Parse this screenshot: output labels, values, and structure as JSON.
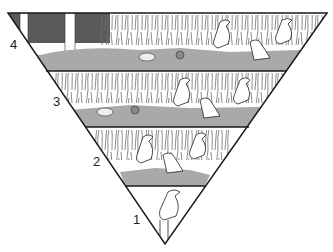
{
  "diagram": {
    "type": "ecological-pyramid",
    "orientation": "inverted-triangle",
    "top_caption_cropped": "(text cut off at top edge)",
    "levels": [
      {
        "number": "1",
        "description": "single heron standing (narrow apex)",
        "birds": 1
      },
      {
        "number": "2",
        "description": "herons among reeds at shallow water",
        "birds": 3
      },
      {
        "number": "3",
        "description": "reeds, pond, duck, crab and several herons",
        "birds": 4
      },
      {
        "number": "4",
        "description": "trees, reeds, pond, duck, crab and several herons",
        "birds": 4
      }
    ],
    "colors": {
      "outline": "#1a1a1a",
      "water": "#a9a9a9",
      "vegetation": "#8c8c8c",
      "trees": "#4d4d4d",
      "background": "#ffffff"
    }
  }
}
